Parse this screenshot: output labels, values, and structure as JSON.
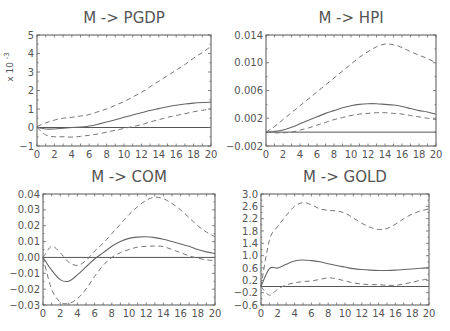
{
  "chart_data": [
    {
      "type": "line",
      "title": "M -> PGDP",
      "ylabel": "x 10⁻³",
      "xlabel": "",
      "x": [
        0,
        1,
        2,
        3,
        4,
        5,
        6,
        7,
        8,
        9,
        10,
        11,
        12,
        13,
        14,
        15,
        16,
        17,
        18,
        19,
        20
      ],
      "xlim": [
        0,
        20
      ],
      "ylim": [
        -1,
        5
      ],
      "xticks": [
        0,
        2,
        4,
        6,
        8,
        10,
        12,
        14,
        16,
        18,
        20
      ],
      "yticks": [
        -1,
        0,
        1,
        2,
        3,
        4,
        5
      ],
      "ytick_labels": [
        "-1",
        "0",
        "1",
        "2",
        "3",
        "4",
        "5"
      ],
      "series": [
        {
          "name": "response",
          "style": "solid",
          "values": [
            0,
            -0.08,
            -0.08,
            -0.04,
            0,
            0.02,
            0.08,
            0.18,
            0.3,
            0.42,
            0.55,
            0.68,
            0.8,
            0.92,
            1.02,
            1.12,
            1.2,
            1.27,
            1.32,
            1.35,
            1.37
          ]
        },
        {
          "name": "upper band",
          "style": "dashed",
          "values": [
            0.05,
            0.25,
            0.4,
            0.5,
            0.55,
            0.62,
            0.7,
            0.85,
            1.0,
            1.2,
            1.4,
            1.65,
            1.9,
            2.2,
            2.5,
            2.8,
            3.1,
            3.4,
            3.75,
            4.05,
            4.38
          ]
        },
        {
          "name": "lower band",
          "style": "dashed",
          "values": [
            0,
            -0.4,
            -0.5,
            -0.5,
            -0.52,
            -0.48,
            -0.42,
            -0.35,
            -0.25,
            -0.15,
            -0.05,
            0.05,
            0.15,
            0.3,
            0.42,
            0.55,
            0.65,
            0.75,
            0.85,
            0.93,
            1.0
          ]
        }
      ]
    },
    {
      "type": "line",
      "title": "M -> HPI",
      "xlabel": "",
      "ylabel": "",
      "x": [
        0,
        1,
        2,
        3,
        4,
        5,
        6,
        7,
        8,
        9,
        10,
        11,
        12,
        13,
        14,
        15,
        16,
        17,
        18,
        19,
        20
      ],
      "xlim": [
        0,
        20
      ],
      "ylim": [
        -0.002,
        0.014
      ],
      "xticks": [
        0,
        2,
        4,
        6,
        8,
        10,
        12,
        14,
        16,
        18,
        20
      ],
      "yticks": [
        -0.002,
        0.002,
        0.006,
        0.01,
        0.014
      ],
      "ytick_labels": [
        "-0.002",
        "0.002",
        "0.006",
        "0.010",
        "0.014"
      ],
      "series": [
        {
          "name": "response",
          "style": "solid",
          "values": [
            0,
            0.0001,
            0.0003,
            0.0007,
            0.0012,
            0.0017,
            0.0022,
            0.0027,
            0.0031,
            0.0035,
            0.0038,
            0.004,
            0.0041,
            0.0041,
            0.004,
            0.0039,
            0.0037,
            0.0034,
            0.0031,
            0.0029,
            0.0026
          ]
        },
        {
          "name": "upper band",
          "style": "dashed",
          "values": [
            0,
            0.0008,
            0.0018,
            0.0028,
            0.0038,
            0.0048,
            0.0058,
            0.0068,
            0.0078,
            0.0088,
            0.0098,
            0.0108,
            0.0116,
            0.0123,
            0.0127,
            0.0126,
            0.0122,
            0.0116,
            0.0111,
            0.0106,
            0.01
          ]
        },
        {
          "name": "lower band",
          "style": "dashed",
          "values": [
            0,
            -0.0001,
            -0.0001,
            0,
            0.0003,
            0.0006,
            0.001,
            0.0014,
            0.0018,
            0.0021,
            0.0024,
            0.0026,
            0.0027,
            0.0028,
            0.0028,
            0.0027,
            0.0026,
            0.0024,
            0.0022,
            0.002,
            0.0018
          ]
        }
      ]
    },
    {
      "type": "line",
      "title": "M -> COM",
      "xlabel": "",
      "ylabel": "",
      "x": [
        0,
        1,
        2,
        3,
        4,
        5,
        6,
        7,
        8,
        9,
        10,
        11,
        12,
        13,
        14,
        15,
        16,
        17,
        18,
        19,
        20
      ],
      "xlim": [
        0,
        20
      ],
      "ylim": [
        -0.03,
        0.04
      ],
      "xticks": [
        0,
        2,
        4,
        6,
        8,
        10,
        12,
        14,
        16,
        18,
        20
      ],
      "yticks": [
        -0.03,
        -0.02,
        -0.01,
        0.0,
        0.01,
        0.02,
        0.03,
        0.04
      ],
      "ytick_labels": [
        "-0.03",
        "-0.02",
        "-0.01",
        "0.00",
        "0.01",
        "0.02",
        "0.03",
        "0.04"
      ],
      "series": [
        {
          "name": "response",
          "style": "solid",
          "values": [
            0,
            -0.008,
            -0.014,
            -0.015,
            -0.011,
            -0.006,
            -0.001,
            0.003,
            0.007,
            0.01,
            0.012,
            0.0128,
            0.013,
            0.0125,
            0.0115,
            0.01,
            0.0085,
            0.007,
            0.005,
            0.0035,
            0.0025
          ]
        },
        {
          "name": "upper band",
          "style": "dashed",
          "values": [
            0,
            0.007,
            0.003,
            -0.003,
            -0.005,
            -0.002,
            0.004,
            0.009,
            0.015,
            0.021,
            0.027,
            0.032,
            0.036,
            0.038,
            0.037,
            0.034,
            0.03,
            0.025,
            0.02,
            0.016,
            0.013
          ]
        },
        {
          "name": "lower band",
          "style": "dashed",
          "values": [
            0,
            -0.02,
            -0.028,
            -0.029,
            -0.026,
            -0.02,
            -0.012,
            -0.005,
            0.0,
            0.003,
            0.005,
            0.0065,
            0.007,
            0.0072,
            0.0068,
            0.005,
            0.003,
            0.001,
            -0.0005,
            -0.0015,
            -0.002
          ]
        }
      ]
    },
    {
      "type": "line",
      "title": "M -> GOLD",
      "xlabel": "",
      "ylabel": "",
      "x": [
        0,
        1,
        2,
        3,
        4,
        5,
        6,
        7,
        8,
        9,
        10,
        11,
        12,
        13,
        14,
        15,
        16,
        17,
        18,
        19,
        20
      ],
      "xlim": [
        0,
        20
      ],
      "ylim": [
        -0.6,
        3.0
      ],
      "xticks": [
        0,
        2,
        4,
        6,
        8,
        10,
        12,
        14,
        16,
        18,
        20
      ],
      "yticks": [
        -0.6,
        -0.2,
        0.2,
        0.6,
        1.0,
        1.4,
        1.8,
        2.2,
        2.6,
        3.0
      ],
      "ytick_labels": [
        "-0.6",
        "-0.2",
        "0.2",
        "0.6",
        "1.0",
        "1.4",
        "1.8",
        "2.2",
        "2.6",
        "3.0"
      ],
      "series": [
        {
          "name": "response",
          "style": "solid",
          "values": [
            0,
            0.58,
            0.6,
            0.72,
            0.83,
            0.86,
            0.84,
            0.8,
            0.74,
            0.68,
            0.63,
            0.58,
            0.55,
            0.53,
            0.52,
            0.52,
            0.53,
            0.55,
            0.57,
            0.59,
            0.61
          ]
        },
        {
          "name": "upper band",
          "style": "dashed",
          "values": [
            0,
            1.5,
            1.95,
            2.3,
            2.6,
            2.72,
            2.65,
            2.52,
            2.47,
            2.45,
            2.38,
            2.22,
            2.05,
            1.92,
            1.85,
            1.88,
            2.02,
            2.2,
            2.35,
            2.45,
            2.52
          ]
        },
        {
          "name": "lower band",
          "style": "dashed",
          "values": [
            0,
            -0.28,
            -0.08,
            0.05,
            0.12,
            0.16,
            0.18,
            0.23,
            0.28,
            0.25,
            0.18,
            0.12,
            0.08,
            0.06,
            0.06,
            0.04,
            0.04,
            0.08,
            0.14,
            0.2,
            0.25
          ]
        }
      ]
    }
  ],
  "panels": [
    {
      "title": "M -> PGDP",
      "scale_label": "x 10",
      "scale_exp": "-3"
    },
    {
      "title": "M -> HPI"
    },
    {
      "title": "M -> COM"
    },
    {
      "title": "M -> GOLD"
    }
  ]
}
